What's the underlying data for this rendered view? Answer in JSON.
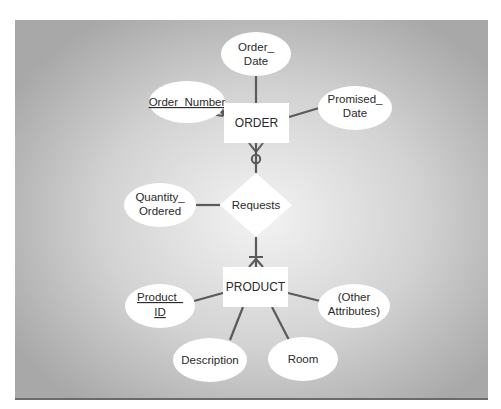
{
  "diagram": {
    "type": "entity-relationship",
    "colors": {
      "panel_center": "#f1f1f1",
      "panel_edge": "#a9a9a9",
      "line": "#5a5a5a",
      "shape_fill": "#ffffff",
      "text": "#2a2a2a"
    },
    "entities": [
      {
        "id": "order",
        "label": "ORDER"
      },
      {
        "id": "product",
        "label": "PRODUCT"
      }
    ],
    "relationship": {
      "label": "Requests",
      "attribute": {
        "line1": "Quantity_",
        "line2": "Ordered"
      }
    },
    "order_attributes": {
      "order_number": {
        "label": "Order_Number",
        "primary_key": true
      },
      "order_date": {
        "line1": "Order_",
        "line2": "Date"
      },
      "promised_date": {
        "line1": "Promised_",
        "line2": "Date"
      }
    },
    "product_attributes": {
      "product_id": {
        "line1": "Product_",
        "line2": "ID",
        "primary_key": true
      },
      "description": {
        "label": "Description"
      },
      "room": {
        "label": "Room"
      },
      "other": {
        "line1": "(Other",
        "line2": "Attributes)"
      }
    },
    "cardinality": {
      "order_side": "zero-or-many",
      "product_side": "one-or-many"
    }
  }
}
